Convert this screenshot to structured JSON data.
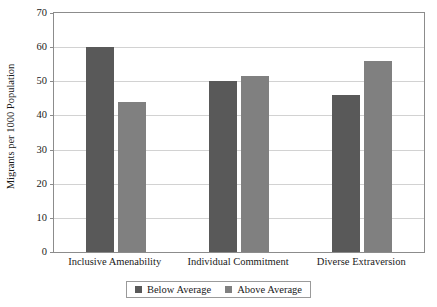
{
  "chart_data": {
    "type": "bar",
    "title": "",
    "xlabel": "",
    "ylabel": "Migrants per 1000 Population",
    "categories": [
      "Inclusive Amenability",
      "Individual Commitment",
      "Diverse Extraversion"
    ],
    "series": [
      {
        "name": "Below Average",
        "color": "#595959",
        "values": [
          60,
          50,
          46
        ]
      },
      {
        "name": "Above Average",
        "color": "#808080",
        "values": [
          44,
          51.5,
          56
        ]
      }
    ],
    "ylim": [
      0,
      70
    ],
    "yticks": [
      0,
      10,
      20,
      30,
      40,
      50,
      60,
      70
    ],
    "grid": "horizontal",
    "legend_position": "bottom"
  },
  "legend": {
    "items": [
      {
        "label": "Below Average",
        "color": "#595959"
      },
      {
        "label": "Above Average",
        "color": "#808080"
      }
    ]
  }
}
